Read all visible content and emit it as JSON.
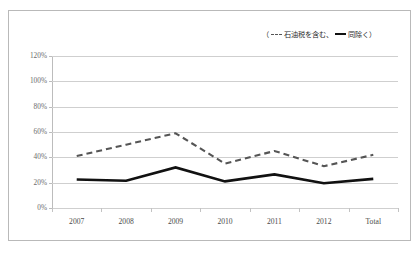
{
  "chart_data": {
    "type": "line",
    "title": "",
    "xlabel": "",
    "ylabel": "",
    "categories": [
      "2007",
      "2008",
      "2009",
      "2010",
      "2011",
      "2012",
      "Total"
    ],
    "ylim": [
      0,
      120
    ],
    "ytick_labels": [
      "0%",
      "20%",
      "40%",
      "60%",
      "80%",
      "100%",
      "120%"
    ],
    "ytick_values": [
      0,
      20,
      40,
      60,
      80,
      100,
      120
    ],
    "grid": "horizontal",
    "legend_position": "top-right",
    "series": [
      {
        "name": "石油税を含む",
        "style": "dashed",
        "color": "#555555",
        "values": [
          41,
          50,
          59,
          35,
          45,
          33,
          42
        ]
      },
      {
        "name": "同除く",
        "style": "solid",
        "color": "#111111",
        "values": [
          22.5,
          21.5,
          32,
          21,
          26.5,
          19.5,
          23
        ]
      }
    ]
  },
  "legend": {
    "open_paren": "（",
    "close_paren": "）",
    "separator": "、",
    "entry_1_label": "石油税を含む",
    "entry_2_label": "同除く"
  }
}
